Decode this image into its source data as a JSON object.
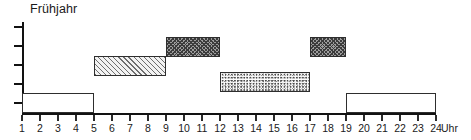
{
  "chart_data": {
    "type": "bar",
    "title": "Frühjahr",
    "subtitle": "",
    "xlabel": "Uhr",
    "ylabel": "",
    "xlim": [
      1,
      24
    ],
    "x_tick_labels": [
      "1",
      "2",
      "3",
      "4",
      "5",
      "6",
      "7",
      "8",
      "9",
      "10",
      "11",
      "12",
      "13",
      "14",
      "15",
      "16",
      "17",
      "18",
      "19",
      "20",
      "21",
      "22",
      "23",
      "24"
    ],
    "x_axis_unit": "Uhr",
    "y_tick_count": 5,
    "y_tick_labels": [],
    "grid": false,
    "legend": "none",
    "orientation": "horizontal-time-blocks",
    "series": [
      {
        "name": "Aktivitätsblock 1",
        "pattern": "empty",
        "start": 1,
        "end": 5,
        "level": 1,
        "label": ""
      },
      {
        "name": "Aktivitätsblock 2",
        "pattern": "diagonal-hatch",
        "start": 5,
        "end": 9,
        "level": 3,
        "label": ""
      },
      {
        "name": "Aktivitätsblock 3",
        "pattern": "dark-crosshatch",
        "start": 9,
        "end": 12,
        "level": 4,
        "label": ""
      },
      {
        "name": "Aktivitätsblock 4",
        "pattern": "stipple",
        "start": 12,
        "end": 17,
        "level": 2,
        "label": ""
      },
      {
        "name": "Aktivitätsblock 5",
        "pattern": "dark-crosshatch",
        "start": 17,
        "end": 19,
        "level": 4,
        "label": ""
      },
      {
        "name": "Aktivitätsblock 6",
        "pattern": "empty",
        "start": 19,
        "end": 24,
        "level": 1,
        "label": ""
      }
    ]
  },
  "colors": {
    "axis": "#121212",
    "bar_border": "#2e2e2e",
    "text": "#1a1a1a",
    "background": "#ffffff",
    "pattern_dark": "#3c3c3c",
    "pattern_light": "#6e6e6e"
  }
}
